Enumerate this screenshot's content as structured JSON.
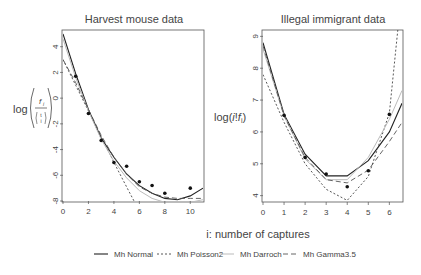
{
  "chart_data": [
    {
      "type": "line",
      "title": "Harvest mouse data",
      "xlabel": "i: number of captures",
      "ylabel": "log(f_i / C(t,i))",
      "xlim": [
        0,
        11
      ],
      "ylim": [
        -8,
        5.3
      ],
      "xticks": [
        0,
        2,
        4,
        6,
        8,
        10
      ],
      "yticks": [
        4,
        2,
        0,
        -2,
        -4,
        -6,
        -8
      ],
      "grid": false,
      "points": {
        "x": [
          1,
          2,
          3,
          4,
          5,
          6,
          7,
          8,
          10
        ],
        "y": [
          1.7,
          -1.2,
          -3.3,
          -5.0,
          -5.3,
          -6.5,
          -6.8,
          -7.4,
          -7.0
        ]
      },
      "series": [
        {
          "name": "Mh Normal",
          "x": [
            0,
            1,
            2,
            3,
            4,
            5,
            6,
            7,
            8,
            9,
            10,
            11
          ],
          "y": [
            5.0,
            1.9,
            -0.9,
            -3.1,
            -4.6,
            -5.9,
            -6.8,
            -7.4,
            -7.8,
            -7.9,
            -7.6,
            -7.0
          ]
        },
        {
          "name": "Mh Poisson2",
          "x": [
            0,
            1,
            2,
            3,
            4,
            5,
            6,
            6.2
          ],
          "y": [
            3.0,
            1.0,
            -1.0,
            -3.0,
            -5.0,
            -6.9,
            -8.8,
            -9.5
          ]
        },
        {
          "name": "Mh Darroch",
          "x": [
            0,
            1,
            2,
            3,
            4,
            5,
            6,
            7,
            8,
            9,
            10,
            11
          ],
          "y": [
            4.6,
            1.6,
            -1.0,
            -3.2,
            -4.9,
            -6.2,
            -7.2,
            -7.8,
            -8.1,
            -8.2,
            -8.1,
            -7.9
          ]
        },
        {
          "name": "Mh Gamma3.5",
          "x": [
            0,
            1,
            2,
            3,
            4,
            5,
            6,
            7,
            8,
            9,
            10,
            11
          ],
          "y": [
            3.0,
            1.2,
            -0.9,
            -2.9,
            -4.6,
            -5.9,
            -6.9,
            -7.4,
            -7.7,
            -7.8,
            -7.8,
            -7.8
          ]
        }
      ]
    },
    {
      "type": "line",
      "title": "Illegal immigrant data",
      "xlabel": "i: number of captures",
      "ylabel": "log(i!f_i)",
      "xlim": [
        0,
        6.6
      ],
      "ylim": [
        3.8,
        9.2
      ],
      "xticks": [
        0,
        1,
        2,
        3,
        4,
        5,
        6
      ],
      "yticks": [
        9,
        8,
        7,
        6,
        5,
        4
      ],
      "grid": false,
      "points": {
        "x": [
          1,
          2,
          3,
          4,
          5,
          6
        ],
        "y": [
          6.52,
          5.2,
          4.68,
          4.28,
          4.78,
          6.55
        ]
      },
      "series": [
        {
          "name": "Mh Normal",
          "x": [
            0,
            1,
            2,
            3,
            4,
            5,
            6,
            6.6
          ],
          "y": [
            8.8,
            6.55,
            5.3,
            4.62,
            4.62,
            5.1,
            6.0,
            6.9
          ]
        },
        {
          "name": "Mh Poisson2",
          "x": [
            0,
            1,
            2,
            3,
            4,
            5,
            6,
            6.4
          ],
          "y": [
            7.8,
            6.3,
            5.0,
            4.2,
            3.85,
            4.6,
            6.6,
            9.2
          ]
        },
        {
          "name": "Mh Darroch",
          "x": [
            0,
            1,
            2,
            3,
            4,
            5,
            6,
            6.6
          ],
          "y": [
            8.6,
            6.5,
            5.15,
            4.5,
            4.5,
            5.2,
            6.4,
            7.3
          ]
        },
        {
          "name": "Mh Gamma3.5",
          "x": [
            0,
            1,
            2,
            3,
            4,
            5,
            6,
            6.6
          ],
          "y": [
            8.7,
            6.5,
            5.2,
            4.5,
            4.4,
            4.8,
            5.7,
            6.3
          ]
        }
      ]
    }
  ],
  "legend": [
    {
      "label": "Mh Normal",
      "dash": "solid",
      "color": "#222222"
    },
    {
      "label": "Mh Poisson2",
      "dash": "dotted",
      "color": "#444444"
    },
    {
      "label": "Mh Darroch",
      "dash": "solid-light",
      "color": "#bbbbbb"
    },
    {
      "label": "Mh Gamma3.5",
      "dash": "dashed",
      "color": "#555555"
    }
  ],
  "shared_xlabel": "i: number of captures"
}
